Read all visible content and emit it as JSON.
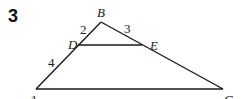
{
  "problem": {
    "number": "3"
  },
  "figure": {
    "vertices": {
      "A": "A",
      "B": "B",
      "C": "C",
      "D": "D",
      "E": "E"
    },
    "lengths": {
      "BD": "2",
      "BE": "3",
      "DA": "4"
    }
  }
}
